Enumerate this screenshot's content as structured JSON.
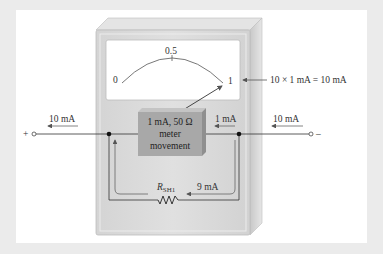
{
  "diagram": {
    "type": "ammeter shunt circuit",
    "scale": {
      "min_label": "0",
      "mid_label": "0.5",
      "max_label": "1"
    },
    "full_scale_annotation": "10 × 1 mA  = 10 mA",
    "meter_movement": {
      "line1": "1 mA, 50 Ω",
      "line2": "meter",
      "line3": "movement"
    },
    "currents": {
      "left_terminal": "10 mA",
      "right_terminal": "10 mA",
      "meter_branch": "1 mA",
      "shunt_branch": "9 mA"
    },
    "shunt_resistor": {
      "label_main": "R",
      "label_sub": "SH1"
    },
    "terminals": {
      "positive": "+",
      "negative": "–"
    },
    "colors": {
      "background": "#ebebeb",
      "panel": "#ffffff",
      "meter_body": "#d9d9d9",
      "meter_face": "#ffffff",
      "movement_box": "#a6a6a6",
      "wire": "#333333",
      "arrow": "#666666"
    }
  }
}
